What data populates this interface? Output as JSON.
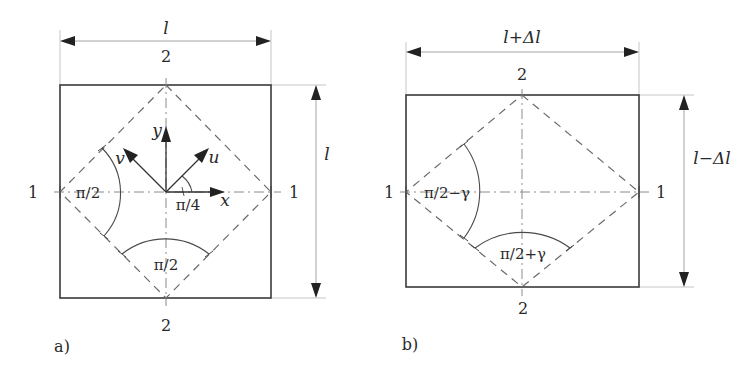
{
  "figure_a": {
    "caption": "a)",
    "width_label": "l",
    "height_label": "l",
    "point_top": "2",
    "point_bottom": "2",
    "point_left": "1",
    "point_right": "1",
    "angle_left": "π/2",
    "angle_bottom": "π/2",
    "angle_u_x": "π/4",
    "axis_x": "x",
    "axis_y": "y",
    "axis_u": "u",
    "axis_v": "v"
  },
  "figure_b": {
    "caption": "b)",
    "width_label": "l+Δl",
    "height_label": "l−Δl",
    "point_top": "2",
    "point_bottom": "2",
    "point_left": "1",
    "point_right": "1",
    "angle_left": "π/2−γ",
    "angle_bottom": "π/2+γ"
  }
}
